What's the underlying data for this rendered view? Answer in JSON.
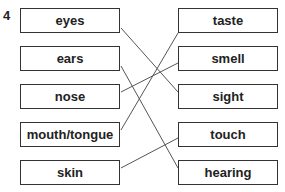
{
  "question_number": "4",
  "left_items": [
    "eyes",
    "ears",
    "nose",
    "mouth/tongue",
    "skin"
  ],
  "right_items": [
    "taste",
    "smell",
    "sight",
    "touch",
    "hearing"
  ],
  "connections": [
    {
      "from": "eyes",
      "to": "sight"
    },
    {
      "from": "ears",
      "to": "hearing"
    },
    {
      "from": "nose",
      "to": "smell"
    },
    {
      "from": "mouth/tongue",
      "to": "taste"
    },
    {
      "from": "skin",
      "to": "touch"
    }
  ],
  "colors": {
    "line": "#555555",
    "border": "#333333",
    "text": "#222222"
  }
}
